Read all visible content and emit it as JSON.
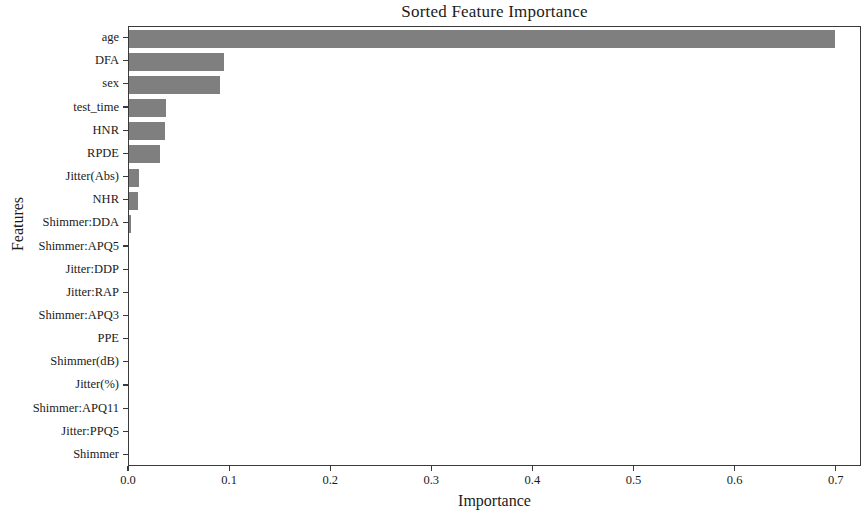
{
  "chart_data": {
    "type": "bar",
    "orientation": "horizontal",
    "title": "Sorted Feature Importance",
    "xlabel": "Importance",
    "ylabel": "Features",
    "xlim": [
      0.0,
      0.725
    ],
    "xticks": [
      0.0,
      0.1,
      0.2,
      0.3,
      0.4,
      0.5,
      0.6,
      0.7
    ],
    "xtick_labels": [
      "0.0",
      "0.1",
      "0.2",
      "0.3",
      "0.4",
      "0.5",
      "0.6",
      "0.7"
    ],
    "grid": false,
    "legend": false,
    "bar_color": "#7f7f7f",
    "categories": [
      "age",
      "DFA",
      "sex",
      "test_time",
      "HNR",
      "RPDE",
      "Jitter(Abs)",
      "NHR",
      "Shimmer:DDA",
      "Shimmer:APQ5",
      "Jitter:DDP",
      "Jitter:RAP",
      "Shimmer:APQ3",
      "PPE",
      "Shimmer(dB)",
      "Jitter(%)",
      "Shimmer:APQ11",
      "Jitter:PPQ5",
      "Shimmer"
    ],
    "values": [
      0.698,
      0.094,
      0.09,
      0.037,
      0.036,
      0.031,
      0.01,
      0.009,
      0.002,
      0.0,
      0.0,
      0.0,
      0.0,
      0.0,
      0.0,
      0.0,
      0.0,
      0.0,
      0.0
    ]
  }
}
